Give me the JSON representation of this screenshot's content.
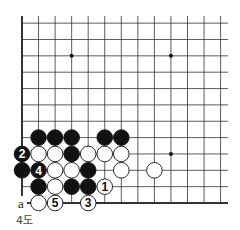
{
  "diagram": {
    "caption": "4도",
    "grid": {
      "origin_x": 22,
      "bottom_y": 203,
      "dx": 16.55,
      "dy": 16.35,
      "cols": 13,
      "rows": 12,
      "top_y": 16,
      "right_x": 228
    },
    "star_points": [
      [
        3,
        9
      ],
      [
        9,
        9
      ],
      [
        9,
        3
      ]
    ],
    "stones": [
      {
        "color": "black",
        "col": 1,
        "row": 4
      },
      {
        "color": "black",
        "col": 2,
        "row": 4
      },
      {
        "color": "black",
        "col": 3,
        "row": 4
      },
      {
        "color": "black",
        "col": 5,
        "row": 4
      },
      {
        "color": "black",
        "col": 6,
        "row": 4
      },
      {
        "color": "black",
        "col": 0,
        "row": 3,
        "label": "2"
      },
      {
        "color": "white",
        "col": 1,
        "row": 3
      },
      {
        "color": "white",
        "col": 2,
        "row": 3
      },
      {
        "color": "black",
        "col": 3,
        "row": 3
      },
      {
        "color": "white",
        "col": 4,
        "row": 3
      },
      {
        "color": "white",
        "col": 5,
        "row": 3
      },
      {
        "color": "white",
        "col": 6,
        "row": 3
      },
      {
        "color": "black",
        "col": 0,
        "row": 2
      },
      {
        "color": "black",
        "col": 1,
        "row": 2,
        "label": "4"
      },
      {
        "color": "white",
        "col": 2,
        "row": 2
      },
      {
        "color": "white",
        "col": 3,
        "row": 2
      },
      {
        "color": "black",
        "col": 4,
        "row": 2
      },
      {
        "color": "white",
        "col": 6,
        "row": 2
      },
      {
        "color": "white",
        "col": 8,
        "row": 2
      },
      {
        "color": "black",
        "col": 1,
        "row": 1
      },
      {
        "color": "white",
        "col": 2,
        "row": 1
      },
      {
        "color": "black",
        "col": 3,
        "row": 1
      },
      {
        "color": "black",
        "col": 4,
        "row": 1
      },
      {
        "color": "white",
        "col": 5,
        "row": 1,
        "label": "1"
      },
      {
        "color": "white",
        "col": 1,
        "row": 0
      },
      {
        "color": "white",
        "col": 2,
        "row": 0,
        "label": "5"
      },
      {
        "color": "white",
        "col": 4,
        "row": 0,
        "label": "3"
      }
    ],
    "markers": [
      {
        "text": "a",
        "col": 0,
        "row": 0
      }
    ]
  }
}
